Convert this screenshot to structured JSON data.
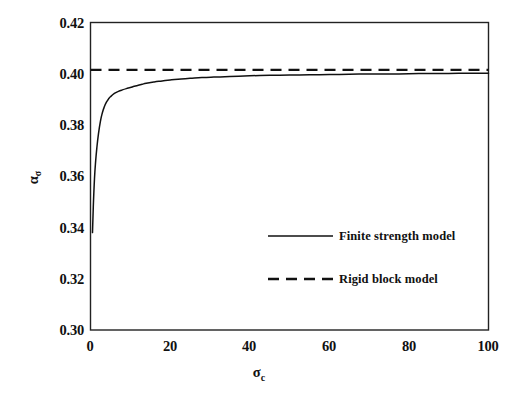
{
  "chart_data": {
    "type": "line",
    "title": "",
    "xlabel": "σc",
    "xlabel_base": "σ",
    "xlabel_sub": "c",
    "ylabel": "ασ",
    "ylabel_base": "α",
    "ylabel_sub": "σ",
    "xlim": [
      0,
      100
    ],
    "ylim": [
      0.3,
      0.42
    ],
    "xticks": [
      0,
      20,
      40,
      60,
      80,
      100
    ],
    "xtick_labels": [
      "0",
      "20",
      "40",
      "60",
      "80",
      "100"
    ],
    "yticks": [
      0.3,
      0.32,
      0.34,
      0.36,
      0.38,
      0.4,
      0.42
    ],
    "ytick_labels": [
      "0.30",
      "0.32",
      "0.34",
      "0.36",
      "0.38",
      "0.40",
      "0.42"
    ],
    "grid": false,
    "frame": true,
    "ticks_visible": false,
    "legend_position": "center-right-inside",
    "series": [
      {
        "name": "Finite strength model",
        "style": "solid",
        "color": "#111111",
        "x": [
          0.5,
          0.7,
          1.0,
          1.3,
          1.6,
          2.0,
          2.5,
          3.0,
          3.5,
          4.0,
          4.5,
          5.0,
          6.0,
          7.0,
          8.0,
          9.0,
          10.0,
          11.0,
          12.0,
          13.0,
          14.0,
          16.0,
          18.0,
          20.0,
          22.0,
          25.0,
          28.0,
          31.0,
          35.0,
          40.0,
          45.0,
          50.0,
          55.0,
          60.0,
          65.0,
          70.0,
          75.0,
          80.0,
          85.0,
          90.0,
          95.0,
          100.0
        ],
        "y": [
          0.338,
          0.348,
          0.359,
          0.366,
          0.3712,
          0.3765,
          0.3815,
          0.3849,
          0.3872,
          0.3889,
          0.3901,
          0.391,
          0.3923,
          0.3931,
          0.3937,
          0.3942,
          0.3946,
          0.3951,
          0.3955,
          0.3959,
          0.3963,
          0.3968,
          0.3972,
          0.3976,
          0.3979,
          0.3982,
          0.3985,
          0.3987,
          0.3989,
          0.3992,
          0.3994,
          0.3995,
          0.3996,
          0.3997,
          0.3998,
          0.3999,
          0.3999,
          0.4,
          0.4001,
          0.4001,
          0.4002,
          0.4002
        ]
      },
      {
        "name": "Rigid block model",
        "style": "dashed",
        "color": "#111111",
        "constant_y": 0.4015,
        "x": [
          0,
          100
        ],
        "y": [
          0.4015,
          0.4015
        ]
      }
    ],
    "annotations": []
  },
  "legend": {
    "items": [
      {
        "label": "Finite strength model",
        "style": "solid"
      },
      {
        "label": "Rigid block model",
        "style": "dashed"
      }
    ]
  },
  "axes": {
    "y_tick_0": "0.42",
    "y_tick_1": "0.40",
    "y_tick_2": "0.38",
    "y_tick_3": "0.36",
    "y_tick_4": "0.34",
    "y_tick_5": "0.32",
    "y_tick_6": "0.30",
    "x_tick_0": "0",
    "x_tick_1": "20",
    "x_tick_2": "40",
    "x_tick_3": "60",
    "x_tick_4": "80",
    "x_tick_5": "100"
  },
  "colors": {
    "background": "#ffffff",
    "ink": "#111111",
    "frame": "#222222"
  }
}
